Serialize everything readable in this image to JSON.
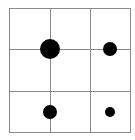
{
  "grid": {
    "left": 9,
    "top": 8,
    "right": 130,
    "bottom": 132,
    "vlines": [
      50,
      90
    ],
    "hlines": [
      49,
      91
    ],
    "line_color": "#8a8a8a"
  },
  "dots": [
    {
      "cx": 50,
      "cy": 49,
      "r": 10,
      "color": "#000000"
    },
    {
      "cx": 110,
      "cy": 49,
      "r": 7,
      "color": "#000000"
    },
    {
      "cx": 50,
      "cy": 112,
      "r": 7,
      "color": "#000000"
    },
    {
      "cx": 110,
      "cy": 112,
      "r": 5,
      "color": "#000000"
    }
  ]
}
